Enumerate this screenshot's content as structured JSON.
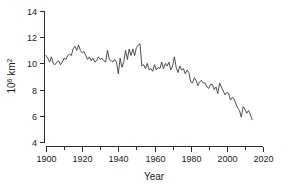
{
  "chart_data": {
    "type": "line",
    "title": "",
    "xlabel": "Year",
    "ylabel": "10^6 km^2",
    "ylabel_mantissa": "10",
    "ylabel_exponent": "6",
    "ylabel_unit": " km",
    "ylabel_unit_exponent": "2",
    "xlim": [
      1900,
      2020
    ],
    "ylim": [
      4,
      14
    ],
    "xticks": [
      1900,
      1920,
      1940,
      1960,
      1980,
      2000,
      2020
    ],
    "xticks_minor": [
      1910,
      1930,
      1950,
      1970,
      1990,
      2010
    ],
    "yticks": [
      4,
      6,
      8,
      10,
      12,
      14
    ],
    "grid": false,
    "legend": "none",
    "line_color": "#303030",
    "axis_color": "#2b2b2b",
    "background": "#ffffff",
    "series": [
      {
        "name": "Sea ice extent",
        "x": [
          1900,
          1901,
          1902,
          1903,
          1904,
          1905,
          1906,
          1907,
          1908,
          1909,
          1910,
          1911,
          1912,
          1913,
          1914,
          1915,
          1916,
          1917,
          1918,
          1919,
          1920,
          1921,
          1922,
          1923,
          1924,
          1925,
          1926,
          1927,
          1928,
          1929,
          1930,
          1931,
          1932,
          1933,
          1934,
          1935,
          1936,
          1937,
          1938,
          1939,
          1940,
          1941,
          1942,
          1943,
          1944,
          1945,
          1946,
          1947,
          1948,
          1949,
          1950,
          1951,
          1952,
          1953,
          1954,
          1955,
          1956,
          1957,
          1958,
          1959,
          1960,
          1961,
          1962,
          1963,
          1964,
          1965,
          1966,
          1967,
          1968,
          1969,
          1970,
          1971,
          1972,
          1973,
          1974,
          1975,
          1976,
          1977,
          1978,
          1979,
          1980,
          1981,
          1982,
          1983,
          1984,
          1985,
          1986,
          1987,
          1988,
          1989,
          1990,
          1991,
          1992,
          1993,
          1994,
          1995,
          1996,
          1997,
          1998,
          1999,
          2000,
          2001,
          2002,
          2003,
          2004,
          2005,
          2006,
          2007,
          2008,
          2009,
          2010,
          2011,
          2012,
          2013,
          2014
        ],
        "values": [
          10.6,
          10.4,
          10.1,
          10.5,
          10.0,
          9.9,
          10.1,
          10.2,
          9.9,
          10.1,
          10.4,
          10.3,
          10.6,
          10.7,
          10.6,
          11.1,
          11.3,
          11.0,
          11.4,
          11.0,
          10.8,
          10.9,
          10.6,
          10.3,
          10.5,
          10.2,
          10.4,
          10.1,
          10.2,
          10.5,
          10.3,
          10.4,
          10.2,
          10.1,
          11.0,
          10.3,
          10.2,
          10.1,
          10.3,
          10.1,
          9.2,
          10.4,
          9.7,
          10.1,
          11.0,
          10.3,
          11.1,
          10.6,
          11.1,
          10.6,
          11.2,
          11.4,
          11.5,
          9.8,
          9.9,
          9.6,
          10.0,
          9.5,
          9.6,
          9.4,
          9.9,
          9.5,
          9.7,
          9.6,
          10.1,
          9.6,
          10.0,
          9.8,
          10.1,
          9.5,
          9.8,
          10.5,
          9.7,
          9.3,
          9.8,
          9.5,
          9.6,
          9.2,
          9.5,
          9.3,
          8.6,
          8.5,
          8.9,
          8.7,
          8.3,
          8.6,
          8.7,
          8.5,
          8.5,
          8.2,
          8.1,
          8.4,
          8.4,
          8.0,
          8.2,
          7.7,
          8.5,
          8.2,
          7.9,
          7.6,
          7.8,
          7.7,
          7.2,
          7.4,
          7.3,
          6.9,
          6.6,
          6.4,
          5.9,
          6.7,
          6.5,
          6.2,
          6.4,
          6.1,
          5.7
        ]
      }
    ]
  },
  "figure": {
    "alt_description": "Line chart of Arctic sea ice extent from 1900 to 2014 declining from about 10.5 to 5.7 million square kilometres"
  }
}
